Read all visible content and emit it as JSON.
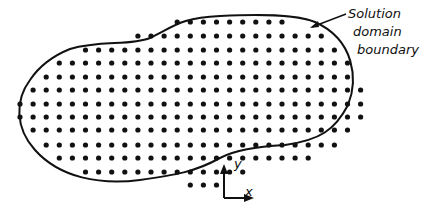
{
  "labels": {
    "boundary_line1": "Solution",
    "boundary_line2": "domain",
    "boundary_line3": "boundary",
    "axis_y": "y",
    "axis_x": "x"
  },
  "grid": {
    "x0": 20,
    "spacing_x": 13.1,
    "dot_radius": 2.6,
    "color": "#111111",
    "rows": [
      {
        "y": 22,
        "from": 12,
        "to": 20
      },
      {
        "y": 36,
        "from": 9,
        "to": 23
      },
      {
        "y": 50,
        "from": 5,
        "to": 24
      },
      {
        "y": 63,
        "from": 3,
        "to": 25
      },
      {
        "y": 77,
        "from": 2,
        "to": 25
      },
      {
        "y": 90,
        "from": 1,
        "to": 26
      },
      {
        "y": 104,
        "from": 0,
        "to": 26
      },
      {
        "y": 117,
        "from": 0,
        "to": 26
      },
      {
        "y": 130,
        "from": 1,
        "to": 25
      },
      {
        "y": 145,
        "from": 2,
        "to": 24
      },
      {
        "y": 158,
        "from": 3,
        "to": 22
      },
      {
        "y": 172,
        "from": 5,
        "to": 17
      },
      {
        "y": 185,
        "from": 13,
        "to": 15
      }
    ]
  }
}
